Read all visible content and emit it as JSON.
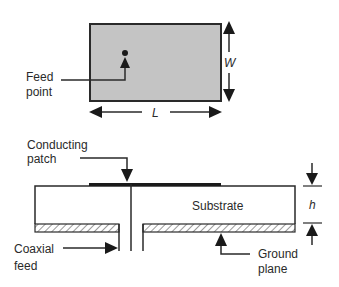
{
  "top_view": {
    "patch_fill": "#c4c4c4",
    "feed_label_line1": "Feed",
    "feed_label_line2": "point",
    "width_label": "W",
    "length_label": "L"
  },
  "side_view": {
    "patch_label_line1": "Conducting",
    "patch_label_line2": "patch",
    "substrate_label": "Substrate",
    "height_label": "h",
    "coax_label_line1": "Coaxial",
    "coax_label_line2": "feed",
    "ground_label_line1": "Ground",
    "ground_label_line2": "plane"
  },
  "colors": {
    "stroke": "#2a2a2a",
    "patch_fill": "#c4c4c4",
    "background": "#ffffff"
  }
}
